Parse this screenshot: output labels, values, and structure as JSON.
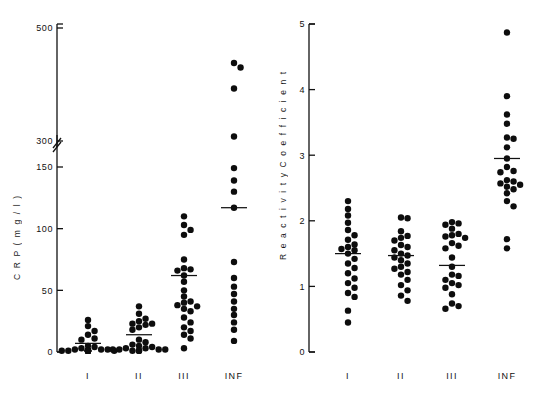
{
  "figure": {
    "background": "#ffffff",
    "ink_color": "#111111",
    "dot_color": "#0d0d0d"
  },
  "chart_data": [
    {
      "type": "scatter",
      "id": "crp-panel",
      "title": "",
      "xlabel": "",
      "ylabel": "CRP (mg/l)",
      "ylabel_display": "C R P ( m g / l )",
      "categories": [
        "I",
        "II",
        "III",
        "INF"
      ],
      "ytick_labels": [
        "0",
        "50",
        "100",
        "150",
        "300",
        "500"
      ],
      "ytick_values": [
        0,
        50,
        100,
        150,
        300,
        500
      ],
      "axis_break": true,
      "axis_break_between": [
        150,
        300
      ],
      "grid": false,
      "legend": "none",
      "median_marker": "horizontal bar",
      "medians": [
        7,
        14,
        62,
        117
      ],
      "series": [
        {
          "name": "I",
          "values": [
            26,
            21,
            17,
            14,
            11,
            10,
            5,
            4,
            3,
            2,
            2,
            2,
            1,
            1,
            1,
            1,
            1,
            1,
            1,
            1,
            1,
            1,
            1,
            1,
            1,
            1,
            1,
            1
          ]
        },
        {
          "name": "II",
          "values": [
            37,
            31,
            27,
            25,
            23,
            23,
            22,
            20,
            18,
            10,
            8,
            6,
            5,
            4,
            3,
            3,
            2,
            2,
            2,
            2,
            1,
            1,
            1,
            1
          ]
        },
        {
          "name": "III",
          "values": [
            110,
            103,
            99,
            95,
            75,
            68,
            67,
            66,
            62,
            57,
            50,
            45,
            41,
            40,
            38,
            37,
            35,
            33,
            28,
            24,
            20,
            17,
            14,
            11,
            3
          ]
        },
        {
          "name": "INF",
          "values": [
            438,
            430,
            393,
            308,
            252,
            139,
            130,
            117,
            73,
            60,
            53,
            47,
            41,
            35,
            30,
            24,
            18,
            9
          ]
        }
      ]
    },
    {
      "type": "scatter",
      "id": "reactivity-panel",
      "title": "",
      "xlabel": "",
      "ylabel": "Reactivity Coefficient",
      "ylabel_display": "R e a c t i v i t y   C o e f f i c i e n t",
      "categories": [
        "I",
        "II",
        "III",
        "INF"
      ],
      "ytick_labels": [
        "0",
        "1",
        "2",
        "3",
        "4",
        "5"
      ],
      "ytick_values": [
        0,
        1,
        2,
        3,
        4,
        5
      ],
      "ylim": [
        0,
        5
      ],
      "axis_break": false,
      "grid": false,
      "legend": "none",
      "median_marker": "horizontal bar",
      "medians": [
        1.5,
        1.47,
        1.32,
        2.95
      ],
      "series": [
        {
          "name": "I",
          "values": [
            2.3,
            2.18,
            2.08,
            1.97,
            1.86,
            1.78,
            1.71,
            1.64,
            1.6,
            1.57,
            1.55,
            1.5,
            1.42,
            1.35,
            1.28,
            1.2,
            1.12,
            1.05,
            0.98,
            0.9,
            0.84,
            0.63,
            0.45
          ]
        },
        {
          "name": "II",
          "values": [
            2.05,
            2.04,
            1.84,
            1.77,
            1.74,
            1.7,
            1.63,
            1.6,
            1.55,
            1.5,
            1.47,
            1.44,
            1.4,
            1.35,
            1.3,
            1.27,
            1.22,
            1.18,
            1.1,
            1.02,
            0.94,
            0.86,
            0.78
          ]
        },
        {
          "name": "III",
          "values": [
            1.98,
            1.96,
            1.94,
            1.88,
            1.8,
            1.78,
            1.76,
            1.74,
            1.66,
            1.62,
            1.58,
            1.44,
            1.3,
            1.18,
            1.16,
            1.1,
            1.05,
            1.02,
            0.98,
            0.88,
            0.74,
            0.7,
            0.66
          ]
        },
        {
          "name": "INF",
          "values": [
            4.87,
            3.9,
            3.62,
            3.48,
            3.27,
            3.25,
            3.12,
            2.95,
            2.82,
            2.76,
            2.74,
            2.62,
            2.6,
            2.57,
            2.55,
            2.52,
            2.48,
            2.42,
            2.3,
            2.22,
            1.72,
            1.58
          ]
        }
      ]
    }
  ]
}
